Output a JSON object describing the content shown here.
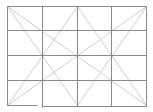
{
  "diagram": {
    "type": "grid-with-diagonals",
    "width": 153,
    "height": 112,
    "colors": {
      "background": "#ffffff",
      "grid": "#8a8a8a",
      "diagonal": "#cfcfcf"
    },
    "grid": {
      "columns": 4,
      "rows": 4,
      "x_lines": [
        7,
        42,
        77,
        111,
        146
      ],
      "y_lines": [
        6,
        30,
        55,
        80,
        105
      ]
    },
    "grid_segments": [
      {
        "name": "top-edge",
        "x1": 7,
        "y1": 6,
        "x2": 146,
        "y2": 6
      },
      {
        "name": "row-line-1",
        "x1": 7,
        "y1": 30,
        "x2": 146,
        "y2": 30
      },
      {
        "name": "row-line-2",
        "x1": 7,
        "y1": 55,
        "x2": 146,
        "y2": 55
      },
      {
        "name": "row-line-3",
        "x1": 7,
        "y1": 80,
        "x2": 146,
        "y2": 80
      },
      {
        "name": "bottom-edge-left",
        "x1": 7,
        "y1": 105,
        "x2": 37,
        "y2": 105
      },
      {
        "name": "bottom-edge-right",
        "x1": 42,
        "y1": 106,
        "x2": 146,
        "y2": 106
      },
      {
        "name": "left-edge",
        "x1": 7,
        "y1": 6,
        "x2": 7,
        "y2": 105
      },
      {
        "name": "col-line-1",
        "x1": 42,
        "y1": 6,
        "x2": 42,
        "y2": 107
      },
      {
        "name": "col-line-2",
        "x1": 77,
        "y1": 6,
        "x2": 77,
        "y2": 106
      },
      {
        "name": "col-line-3",
        "x1": 111,
        "y1": 6,
        "x2": 111,
        "y2": 106
      },
      {
        "name": "right-edge",
        "x1": 146,
        "y1": 6,
        "x2": 146,
        "y2": 106
      }
    ],
    "diagonals": [
      {
        "name": "top-left-to-bottom-right",
        "x1": 7,
        "y1": 6,
        "x2": 146,
        "y2": 105
      },
      {
        "name": "top-right-to-bottom-left",
        "x1": 146,
        "y1": 6,
        "x2": 7,
        "y2": 105
      },
      {
        "name": "top-left-to-bottom-center",
        "x1": 7,
        "y1": 6,
        "x2": 77,
        "y2": 105
      },
      {
        "name": "top-right-to-bottom-center",
        "x1": 146,
        "y1": 6,
        "x2": 77,
        "y2": 105
      },
      {
        "name": "top-center-to-bottom-left",
        "x1": 77,
        "y1": 6,
        "x2": 7,
        "y2": 105
      },
      {
        "name": "top-center-to-bottom-right",
        "x1": 77,
        "y1": 6,
        "x2": 146,
        "y2": 105
      }
    ]
  }
}
